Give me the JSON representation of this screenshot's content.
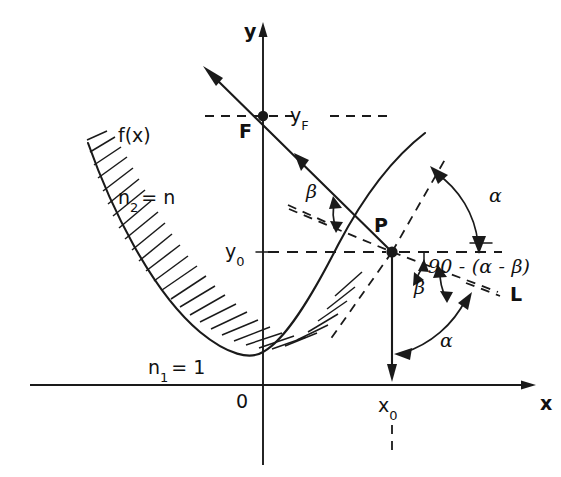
{
  "figure": {
    "type": "optics-geometry-diagram",
    "background_color": "#ffffff",
    "ink_color": "#1a1a1a"
  },
  "axes": {
    "x_label": "x",
    "y_label": "y",
    "origin_label": "0",
    "x_axis_y_px": 385,
    "y_axis_x_px": 263,
    "x_range_px": [
      30,
      536
    ],
    "y_range_px": [
      22,
      465
    ]
  },
  "labels": {
    "curve": "f(x)",
    "focus_point": "F",
    "reflection_point": "P",
    "y_focus": "y",
    "y_focus_sub": "F",
    "y_zero": "y",
    "y_zero_sub": "0",
    "x_zero": "x",
    "x_zero_sub": "0",
    "index_upper_main": "n",
    "index_upper_sub": "2",
    "index_upper_value": "= n",
    "index_lower_main": "n",
    "index_lower_sub": "1",
    "index_lower_value": "= 1",
    "normal_line": "L",
    "alpha_upper": "α",
    "alpha_lower": "α",
    "beta_upper": "β",
    "beta_lower": "β",
    "angle_expression": "90 - (α - β)"
  },
  "geometry": {
    "focus_px": [
      263,
      116
    ],
    "point_p_px": [
      392,
      252
    ],
    "parabola_vertex_px": [
      263,
      352
    ],
    "incident_ray_arrow_tip_px": [
      205,
      68
    ],
    "vertical_drop_arrow_tip_px": [
      392,
      378
    ],
    "hatching_side": "convex-outer",
    "hatch_angle_deg": 45
  },
  "annotations": {
    "media_note_upper": "n2 = n (inside medium)",
    "media_note_lower": "n1 = 1 (outside medium)"
  }
}
